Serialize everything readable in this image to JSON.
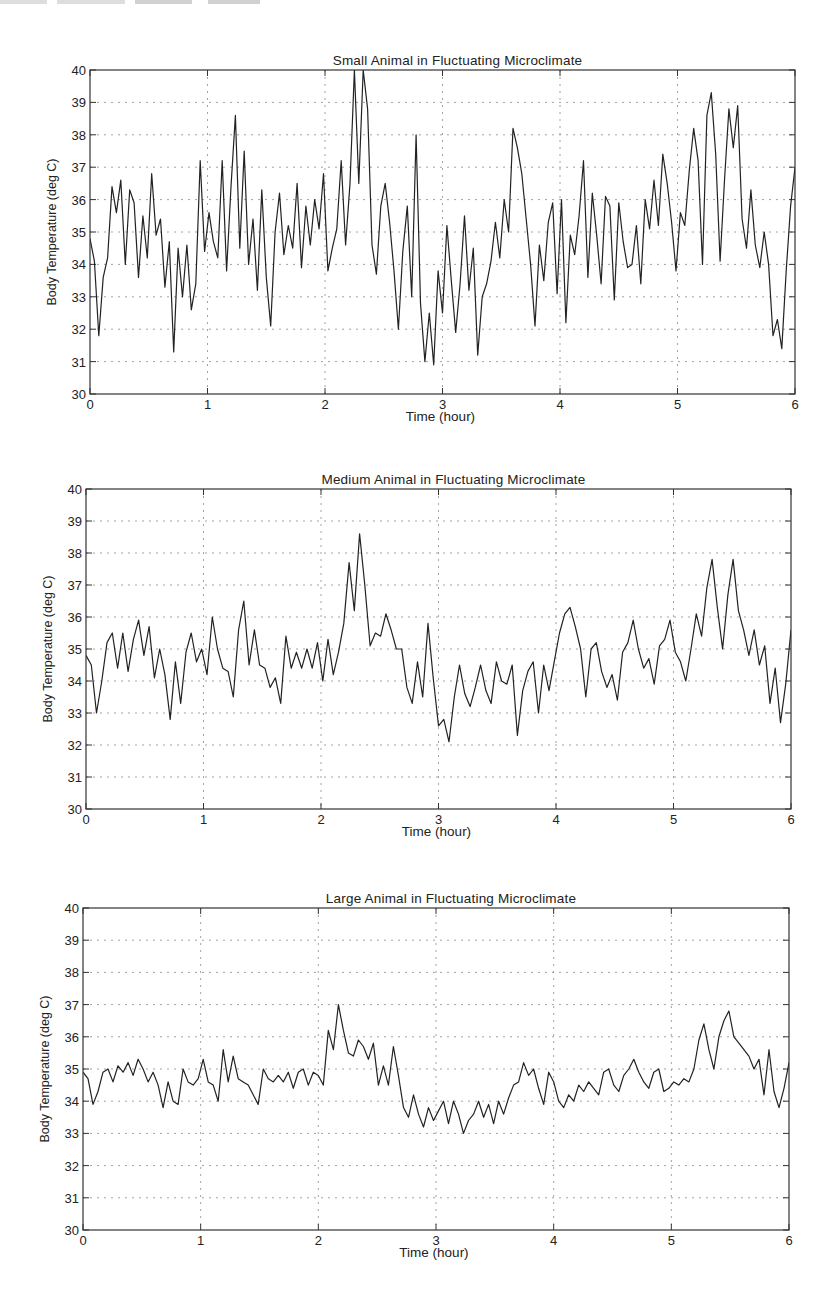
{
  "page": {
    "header_fragment_visible": true
  },
  "chart_data": [
    {
      "type": "line",
      "title": "Small Animal in Fluctuating Microclimate",
      "xlabel": "Time (hour)",
      "ylabel": "Body Temperature (deg C)",
      "xlim": [
        0,
        6
      ],
      "ylim": [
        30,
        40
      ],
      "xticks": [
        0,
        1,
        2,
        3,
        4,
        5,
        6
      ],
      "yticks": [
        30,
        31,
        32,
        33,
        34,
        35,
        36,
        37,
        38,
        39,
        40
      ],
      "grid": true,
      "box": {
        "left": 90,
        "top": 70,
        "right": 795,
        "bottom": 394
      },
      "series": [
        {
          "name": "Small animal body temperature",
          "x": [
            0,
            0.05,
            0.1,
            0.15,
            0.2,
            0.25,
            0.3,
            0.35,
            0.4,
            0.45,
            0.5,
            0.55,
            0.6,
            0.65,
            0.7,
            0.75,
            0.8,
            0.85,
            0.9,
            0.95,
            1.0,
            1.05,
            1.1,
            1.15,
            1.2,
            1.25,
            1.3,
            1.35,
            1.4,
            1.45,
            1.5,
            1.55,
            1.6,
            1.65,
            1.7,
            1.75,
            1.8,
            1.85,
            1.9,
            1.95,
            2.0,
            2.05,
            2.1,
            2.15,
            2.2,
            2.25,
            2.3,
            2.35,
            2.4,
            2.45,
            2.5,
            2.55,
            2.6,
            2.65,
            2.7,
            2.75,
            2.8,
            2.85,
            2.9,
            2.95,
            3.0,
            3.05,
            3.1,
            3.15,
            3.2,
            3.25,
            3.3,
            3.35,
            3.4,
            3.45,
            3.5,
            3.55,
            3.6,
            3.65,
            3.7,
            3.75,
            3.8,
            3.85,
            3.9,
            3.95,
            4.0,
            4.05,
            4.1,
            4.15,
            4.2,
            4.25,
            4.3,
            4.35,
            4.4,
            4.45,
            4.5,
            4.55,
            4.6,
            4.65,
            4.7,
            4.75,
            4.8,
            4.85,
            4.9,
            4.95,
            5.0,
            5.05,
            5.1,
            5.15,
            5.2,
            5.25,
            5.3,
            5.35,
            5.4,
            5.45,
            5.5,
            5.55,
            5.6,
            5.65,
            5.7,
            5.75,
            5.8,
            5.85,
            5.9,
            5.95,
            6.0
          ],
          "y": [
            34.8,
            34.1,
            31.8,
            33.6,
            34.2,
            36.4,
            35.6,
            36.6,
            34.0,
            36.3,
            35.9,
            33.6,
            35.5,
            34.2,
            36.8,
            34.9,
            35.4,
            33.3,
            34.7,
            31.3,
            34.5,
            33.0,
            34.6,
            32.6,
            33.4,
            37.2,
            34.4,
            35.6,
            34.7,
            34.2,
            37.2,
            33.8,
            36.4,
            38.6,
            34.5,
            37.5,
            34.0,
            35.4,
            33.2,
            36.3,
            33.6,
            32.1,
            35.0,
            36.2,
            34.3,
            35.2,
            34.5,
            36.5,
            33.9,
            35.8,
            34.6,
            36.0,
            35.1,
            36.8,
            33.8,
            34.5,
            35.1,
            37.2,
            34.6,
            36.5,
            40.0,
            36.5,
            40.0,
            38.8,
            34.6,
            33.7,
            35.8,
            36.5,
            35.3,
            33.8,
            32.0,
            34.4,
            35.8,
            33.0,
            38.0,
            32.8,
            31.0,
            32.5,
            30.9,
            33.8,
            32.5,
            35.2,
            33.5,
            31.9,
            33.4,
            35.5,
            33.2,
            34.5,
            31.2,
            33.0,
            33.4,
            34.1,
            35.3,
            34.2,
            36.0,
            35.0,
            38.2,
            37.6,
            36.8,
            35.4,
            34.0,
            32.1,
            34.6,
            33.5,
            35.3,
            35.9,
            33.1,
            36.0,
            32.2,
            34.9,
            34.3,
            35.5,
            37.2,
            33.6,
            36.2,
            34.9,
            33.4,
            36.1,
            35.8,
            32.9,
            35.9,
            34.7,
            33.9,
            34.0,
            35.2,
            33.4,
            36.0,
            35.1,
            36.6,
            35.2,
            37.4,
            36.5,
            35.3,
            33.8,
            35.6,
            35.2,
            36.9,
            38.2,
            37.2,
            34.0,
            38.6,
            39.3,
            37.4,
            34.1,
            36.6,
            38.8,
            37.6,
            38.9,
            35.4,
            34.5,
            36.3,
            34.6,
            33.9,
            35.0,
            34.0,
            31.8,
            32.3,
            31.4,
            33.8,
            35.8,
            37.0
          ],
          "note": "values approximated from trace; x listed at 0.05 h spacing (first 121 y values align with x; remainder are intermediate fine-detail samples)"
        }
      ]
    },
    {
      "type": "line",
      "title": "Medium Animal in Fluctuating Microclimate",
      "xlabel": "Time (hour)",
      "ylabel": "Body Temperature (deg C)",
      "xlim": [
        0,
        6
      ],
      "ylim": [
        30,
        40
      ],
      "xticks": [
        0,
        1,
        2,
        3,
        4,
        5,
        6
      ],
      "yticks": [
        30,
        31,
        32,
        33,
        34,
        35,
        36,
        37,
        38,
        39,
        40
      ],
      "grid": true,
      "box": {
        "left": 86,
        "top": 489,
        "right": 791,
        "bottom": 809
      },
      "series": [
        {
          "name": "Medium animal body temperature",
          "x": [
            0,
            0.05,
            0.1,
            0.15,
            0.2,
            0.25,
            0.3,
            0.35,
            0.4,
            0.45,
            0.5,
            0.55,
            0.6,
            0.65,
            0.7,
            0.75,
            0.8,
            0.85,
            0.9,
            0.95,
            1.0,
            1.05,
            1.1,
            1.15,
            1.2,
            1.25,
            1.3,
            1.35,
            1.4,
            1.45,
            1.5,
            1.55,
            1.6,
            1.65,
            1.7,
            1.75,
            1.8,
            1.85,
            1.9,
            1.95,
            2.0,
            2.05,
            2.1,
            2.15,
            2.2,
            2.25,
            2.3,
            2.35,
            2.4,
            2.45,
            2.5,
            2.55,
            2.6,
            2.65,
            2.7,
            2.75,
            2.8,
            2.85,
            2.9,
            2.95,
            3.0,
            3.05,
            3.1,
            3.15,
            3.2,
            3.25,
            3.3,
            3.35,
            3.4,
            3.45,
            3.5,
            3.55,
            3.6,
            3.65,
            3.7,
            3.75,
            3.8,
            3.85,
            3.9,
            3.95,
            4.0,
            4.05,
            4.1,
            4.15,
            4.2,
            4.25,
            4.3,
            4.35,
            4.4,
            4.45,
            4.5,
            4.55,
            4.6,
            4.65,
            4.7,
            4.75,
            4.8,
            4.85,
            4.9,
            4.95,
            5.0,
            5.05,
            5.1,
            5.15,
            5.2,
            5.25,
            5.3,
            5.35,
            5.4,
            5.45,
            5.5,
            5.55,
            5.6,
            5.65,
            5.7,
            5.75,
            5.8,
            5.85,
            5.9,
            5.95,
            6.0
          ],
          "y": [
            34.8,
            34.5,
            33.0,
            34.0,
            35.2,
            35.5,
            34.4,
            35.5,
            34.3,
            35.3,
            35.9,
            34.8,
            35.7,
            34.1,
            35.0,
            34.2,
            32.8,
            34.6,
            33.3,
            34.9,
            35.5,
            34.6,
            35.0,
            34.2,
            36.0,
            35.0,
            34.4,
            34.3,
            33.5,
            35.6,
            36.5,
            34.5,
            35.6,
            34.5,
            34.4,
            33.8,
            34.1,
            33.3,
            35.4,
            34.4,
            34.9,
            34.4,
            35.0,
            34.4,
            35.2,
            34.0,
            35.3,
            34.2,
            34.9,
            35.8,
            37.7,
            36.2,
            38.6,
            37.0,
            35.1,
            35.5,
            35.4,
            36.1,
            35.6,
            35.0,
            35.0,
            33.8,
            33.3,
            34.6,
            33.5,
            35.8,
            34.1,
            32.6,
            32.8,
            32.1,
            33.5,
            34.5,
            33.6,
            33.2,
            33.8,
            34.5,
            33.7,
            33.3,
            34.6,
            34.0,
            33.9,
            34.5,
            32.3,
            33.7,
            34.3,
            34.6,
            33.0,
            34.5,
            33.7,
            34.6,
            35.5,
            36.1,
            36.3,
            35.7,
            35.0,
            33.5,
            35.0,
            35.2,
            34.3,
            33.8,
            34.2,
            33.4,
            34.9,
            35.2,
            35.9,
            35.0,
            34.4,
            34.7,
            33.9,
            35.1,
            35.3,
            35.9,
            34.9,
            34.6,
            34.0,
            35.0,
            36.1,
            35.4,
            36.9,
            37.8,
            36.3,
            35.0,
            36.7,
            37.8,
            36.2,
            35.6,
            34.8,
            35.6,
            34.5,
            35.1,
            33.3,
            34.4,
            32.7,
            33.9,
            35.6
          ],
          "note": "values approximated from trace"
        }
      ]
    },
    {
      "type": "line",
      "title": "Large Animal in Fluctuating Microclimate",
      "xlabel": "Time (hour)",
      "ylabel": "Body Temperature (deg C)",
      "xlim": [
        0,
        6
      ],
      "ylim": [
        30,
        40
      ],
      "xticks": [
        0,
        1,
        2,
        3,
        4,
        5,
        6
      ],
      "yticks": [
        30,
        31,
        32,
        33,
        34,
        35,
        36,
        37,
        38,
        39,
        40
      ],
      "grid": true,
      "box": {
        "left": 83,
        "top": 908,
        "right": 789,
        "bottom": 1230
      },
      "series": [
        {
          "name": "Large animal body temperature",
          "x": [
            0,
            0.05,
            0.1,
            0.15,
            0.2,
            0.25,
            0.3,
            0.35,
            0.4,
            0.45,
            0.5,
            0.55,
            0.6,
            0.65,
            0.7,
            0.75,
            0.8,
            0.85,
            0.9,
            0.95,
            1.0,
            1.05,
            1.1,
            1.15,
            1.2,
            1.25,
            1.3,
            1.35,
            1.4,
            1.45,
            1.5,
            1.55,
            1.6,
            1.65,
            1.7,
            1.75,
            1.8,
            1.85,
            1.9,
            1.95,
            2.0,
            2.05,
            2.1,
            2.15,
            2.2,
            2.25,
            2.3,
            2.35,
            2.4,
            2.45,
            2.5,
            2.55,
            2.6,
            2.65,
            2.7,
            2.75,
            2.8,
            2.85,
            2.9,
            2.95,
            3.0,
            3.05,
            3.1,
            3.15,
            3.2,
            3.25,
            3.3,
            3.35,
            3.4,
            3.45,
            3.5,
            3.55,
            3.6,
            3.65,
            3.7,
            3.75,
            3.8,
            3.85,
            3.9,
            3.95,
            4.0,
            4.05,
            4.1,
            4.15,
            4.2,
            4.25,
            4.3,
            4.35,
            4.4,
            4.45,
            4.5,
            4.55,
            4.6,
            4.65,
            4.7,
            4.75,
            4.8,
            4.85,
            4.9,
            4.95,
            5.0,
            5.05,
            5.1,
            5.15,
            5.2,
            5.25,
            5.3,
            5.35,
            5.4,
            5.45,
            5.5,
            5.55,
            5.6,
            5.65,
            5.7,
            5.75,
            5.8,
            5.85,
            5.9,
            5.95,
            6.0
          ],
          "y": [
            34.9,
            34.7,
            33.9,
            34.3,
            34.9,
            35.0,
            34.6,
            35.1,
            34.9,
            35.2,
            34.8,
            35.3,
            35.0,
            34.6,
            34.9,
            34.5,
            33.8,
            34.6,
            34.0,
            33.9,
            35.0,
            34.6,
            34.5,
            34.7,
            35.3,
            34.6,
            34.5,
            34.0,
            35.6,
            34.6,
            35.4,
            34.7,
            34.6,
            34.5,
            34.2,
            33.9,
            35.0,
            34.7,
            34.6,
            34.8,
            34.6,
            34.9,
            34.4,
            34.9,
            35.0,
            34.5,
            34.9,
            34.8,
            34.5,
            36.2,
            35.6,
            37.0,
            36.2,
            35.5,
            35.4,
            35.9,
            35.7,
            35.3,
            35.8,
            34.5,
            35.1,
            34.5,
            35.7,
            34.8,
            33.8,
            33.5,
            34.2,
            33.6,
            33.2,
            33.8,
            33.4,
            33.7,
            34.0,
            33.3,
            34.0,
            33.6,
            33.0,
            33.4,
            33.6,
            34.0,
            33.5,
            33.9,
            33.3,
            34.0,
            33.6,
            34.1,
            34.5,
            34.6,
            35.2,
            34.8,
            35.0,
            34.4,
            33.9,
            34.9,
            34.6,
            34.0,
            33.8,
            34.2,
            34.0,
            34.5,
            34.3,
            34.6,
            34.4,
            34.2,
            34.9,
            35.0,
            34.5,
            34.3,
            34.8,
            35.0,
            35.3,
            34.9,
            34.6,
            34.4,
            34.9,
            35.0,
            34.3,
            34.4,
            34.6,
            34.5,
            34.7,
            34.6,
            35.0,
            35.9,
            36.4,
            35.6,
            35.0,
            36.0,
            36.5,
            36.8,
            36.0,
            35.8,
            35.6,
            35.4,
            35.0,
            35.3,
            34.2,
            35.6,
            34.3,
            33.8,
            34.4,
            35.2
          ],
          "note": "values approximated from trace"
        }
      ]
    }
  ]
}
